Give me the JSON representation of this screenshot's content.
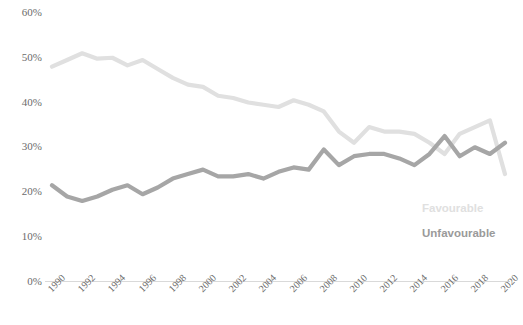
{
  "chart_data": {
    "type": "line",
    "title": "",
    "subtitle": "",
    "xlabel": "",
    "ylabel": "",
    "x": [
      1990,
      1991,
      1992,
      1993,
      1994,
      1995,
      1996,
      1997,
      1998,
      1999,
      2000,
      2001,
      2002,
      2003,
      2004,
      2005,
      2006,
      2007,
      2008,
      2009,
      2010,
      2011,
      2012,
      2013,
      2014,
      2015,
      2016,
      2017,
      2018,
      2019,
      2020
    ],
    "xtick_labels": [
      "1990",
      "1992",
      "1994",
      "1996",
      "1998",
      "2000",
      "2002",
      "2004",
      "2006",
      "2008",
      "2010",
      "2012",
      "2014",
      "2016",
      "2018",
      "2020"
    ],
    "xticks": [
      1990,
      1992,
      1994,
      1996,
      1998,
      2000,
      2002,
      2004,
      2006,
      2008,
      2010,
      2012,
      2014,
      2016,
      2018,
      2020
    ],
    "ytick_labels": [
      "0%",
      "10%",
      "20%",
      "30%",
      "40%",
      "50%",
      "60%"
    ],
    "yticks": [
      0,
      10,
      20,
      30,
      40,
      50,
      60
    ],
    "ylim": [
      0,
      60
    ],
    "xlim": [
      1990,
      2020
    ],
    "grid": false,
    "legend_position": "bottom-right",
    "series": [
      {
        "name": "Favourable",
        "color": "#e0e0e0",
        "values": [
          48.0,
          49.5,
          51.0,
          49.8,
          50.0,
          48.3,
          49.5,
          47.5,
          45.5,
          44.0,
          43.5,
          41.5,
          41.0,
          40.0,
          39.5,
          39.0,
          40.5,
          39.5,
          38.0,
          33.5,
          31.0,
          34.5,
          33.5,
          33.5,
          33.0,
          31.0,
          28.5,
          33.0,
          34.5,
          36.0,
          24.0
        ]
      },
      {
        "name": "Unfavourable",
        "color": "#a6a6a6",
        "values": [
          21.5,
          19.0,
          18.0,
          19.0,
          20.5,
          21.5,
          19.5,
          21.0,
          23.0,
          24.0,
          25.0,
          23.5,
          23.5,
          24.0,
          23.0,
          24.5,
          25.5,
          25.0,
          29.5,
          26.0,
          28.0,
          28.5,
          28.5,
          27.5,
          26.0,
          28.5,
          32.5,
          28.0,
          30.0,
          28.5,
          31.0
        ]
      }
    ]
  },
  "legend": {
    "items": [
      {
        "label": "Favourable",
        "color": "#e0e0e0"
      },
      {
        "label": "Unfavourable",
        "color": "#a6a6a6"
      }
    ]
  },
  "axis": {
    "line_color": "#d9d9d9",
    "label_color": "#6b6b6b"
  }
}
